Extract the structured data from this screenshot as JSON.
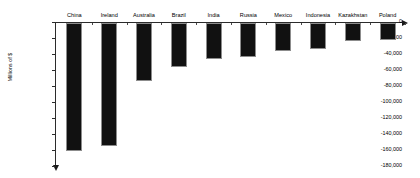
{
  "chart_data": {
    "type": "bar",
    "title": "",
    "subtitle": "",
    "xlabel": "",
    "ylabel": "Millions of $",
    "categories": [
      "China",
      "Ireland",
      "Australia",
      "Brazil",
      "India",
      "Russia",
      "Mexico",
      "Indonesia",
      "Kazakhstan",
      "Poland"
    ],
    "values": [
      -160000,
      -154000,
      -72500,
      -55000,
      -45000,
      -42500,
      -35000,
      -32500,
      -22000,
      -21500
    ],
    "series": [
      {
        "name": "Net position",
        "values": [
          -160000,
          -154000,
          -72500,
          -55000,
          -45000,
          -42500,
          -35000,
          -32500,
          -22000,
          -21500
        ]
      }
    ],
    "ylim": [
      -180000,
      0
    ],
    "ytick_values": [
      0,
      -20000,
      -40000,
      -60000,
      -80000,
      -100000,
      -120000,
      -140000,
      -160000,
      -180000
    ],
    "ytick_labels": [
      "0",
      "-20,000",
      "-40,000",
      "-60,000",
      "-80,000",
      "-100,000",
      "-120,000",
      "-140,000",
      "-160,000",
      "-180,000"
    ],
    "grid": false,
    "legend": false,
    "legend_position": "none",
    "bar_color": "#111111",
    "axis_color": "#2b2b2b",
    "category_labels_position": "top",
    "annotations": []
  }
}
